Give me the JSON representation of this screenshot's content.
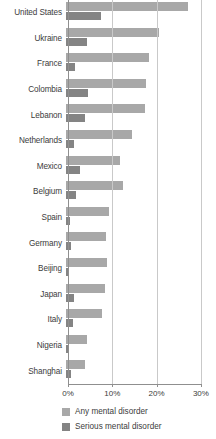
{
  "chart_data": {
    "type": "bar",
    "orientation": "horizontal",
    "title": "",
    "subtitle": "",
    "xlabel": "",
    "ylabel": "",
    "xlim": [
      0,
      30
    ],
    "xtick_labels": [
      "0%",
      "10%",
      "20%",
      "30%"
    ],
    "xticks": [
      0,
      10,
      20,
      30
    ],
    "grid": true,
    "grid_axis": "x",
    "legend_position": "bottom",
    "value_unit": "%",
    "categories": [
      "United States",
      "Ukraine",
      "France",
      "Colombia",
      "Lebanon",
      "Netherlands",
      "Mexico",
      "Belgium",
      "Spain",
      "Germany",
      "Beijing",
      "Japan",
      "Italy",
      "Nigeria",
      "Shanghai"
    ],
    "series": [
      {
        "name": "Any mental disorder",
        "color": "#a8a8a8",
        "values": [
          27.5,
          21.0,
          18.7,
          18.0,
          17.8,
          14.9,
          12.3,
          12.8,
          9.6,
          9.1,
          9.2,
          8.9,
          8.2,
          4.7,
          4.3
        ]
      },
      {
        "name": "Serious mental disorder",
        "color": "#848484",
        "values": [
          7.9,
          4.8,
          2.0,
          5.0,
          4.3,
          1.8,
          3.2,
          2.3,
          1.0,
          1.2,
          0.7,
          1.7,
          1.5,
          0.4,
          1.1
        ]
      }
    ]
  },
  "legend": {
    "items": [
      {
        "label": "Any mental disorder",
        "color": "#a8a8a8"
      },
      {
        "label": "Serious mental disorder",
        "color": "#848484"
      }
    ]
  }
}
